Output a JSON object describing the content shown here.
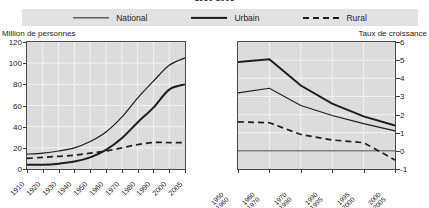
{
  "title": "1950-2005",
  "legend": {
    "position": "top",
    "items": [
      {
        "label": "National",
        "style": "thin-solid-line",
        "icon": "line-swatch-icon"
      },
      {
        "label": "Urbain",
        "style": "thick-solid-line",
        "icon": "line-swatch-icon"
      },
      {
        "label": "Rural",
        "style": "dashed-line",
        "icon": "dashed-line-swatch-icon"
      }
    ]
  },
  "left_caption": "Million de personnes",
  "right_caption": "Taux de croissance",
  "chart_data": [
    {
      "type": "line",
      "title": "Million de personnes",
      "xlabel": "",
      "ylabel": "Million de personnes",
      "ylim": [
        0,
        120
      ],
      "yticks": [
        0,
        20,
        40,
        60,
        80,
        100,
        120
      ],
      "ytick_labels": [
        "0",
        "20",
        "40",
        "60",
        "80",
        "100",
        "120"
      ],
      "grid": true,
      "legend_position": "top",
      "categories": [
        "1910",
        "1920",
        "1930",
        "1940",
        "1950",
        "1960",
        "1970",
        "1980",
        "1990",
        "2000",
        "2005"
      ],
      "series": [
        {
          "name": "National",
          "values": [
            14,
            15,
            17,
            20,
            26,
            35,
            49,
            67,
            83,
            98,
            105
          ]
        },
        {
          "name": "Urbain",
          "values": [
            4,
            4,
            5,
            7,
            11,
            18,
            29,
            44,
            58,
            75,
            80
          ]
        },
        {
          "name": "Rural",
          "values": [
            10,
            11,
            12,
            13,
            15,
            17,
            20,
            23,
            25,
            25,
            25
          ]
        }
      ]
    },
    {
      "type": "line",
      "title": "Taux de croissance",
      "xlabel": "",
      "ylabel": "Taux de croissance",
      "ylim": [
        -1,
        6
      ],
      "yticks": [
        -1,
        0,
        1,
        2,
        3,
        4,
        5,
        6
      ],
      "ytick_labels": [
        "-1",
        "0",
        "1",
        "2",
        "3",
        "4",
        "5",
        "6"
      ],
      "grid": true,
      "legend_position": "top",
      "categories": [
        "1950-1960",
        "1960-1970",
        "1970-1990",
        "1990-1995",
        "1995-2000",
        "2000-2005"
      ],
      "series": [
        {
          "name": "Urbain",
          "values": [
            4.9,
            5.05,
            3.6,
            2.6,
            1.9,
            1.4
          ]
        },
        {
          "name": "National",
          "values": [
            3.2,
            3.45,
            2.5,
            1.95,
            1.5,
            1.1
          ]
        },
        {
          "name": "Rural",
          "values": [
            1.6,
            1.55,
            0.9,
            0.6,
            0.45,
            -0.5
          ]
        }
      ]
    }
  ]
}
